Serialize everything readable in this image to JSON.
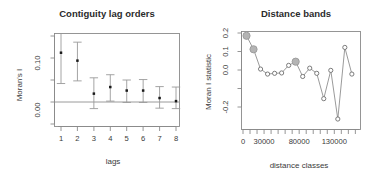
{
  "figure": {
    "background": "#ffffff",
    "width": 385,
    "height": 180
  },
  "chart_data": [
    {
      "id": "contiguity-lag-orders",
      "type": "scatter",
      "title": "Contiguity lag orders",
      "xlabel": "lags",
      "ylabel": "Moran's I",
      "grid": false,
      "legend": null,
      "xlim": [
        0.5,
        8.5
      ],
      "ylim": [
        -0.035,
        0.175
      ],
      "xticks": [
        1,
        2,
        3,
        4,
        5,
        6,
        7,
        8
      ],
      "xtick_labels": [
        "1",
        "2",
        "3",
        "4",
        "5",
        "6",
        "7",
        "8"
      ],
      "yticks": [
        0.0,
        0.1
      ],
      "ytick_labels": [
        "0.00",
        "0.10"
      ],
      "yticks_minor": [
        0.05,
        0.15
      ],
      "reference_line_y": 0.0,
      "categories": [
        "1",
        "2",
        "3",
        "4",
        "5",
        "6",
        "7",
        "8"
      ],
      "values": [
        0.112,
        0.094,
        0.019,
        0.034,
        0.026,
        0.026,
        0.009,
        0.002
      ],
      "error_low": [
        0.042,
        0.048,
        -0.015,
        0.002,
        -0.001,
        -0.001,
        -0.014,
        -0.015
      ],
      "error_high": [
        0.175,
        0.136,
        0.055,
        0.062,
        0.05,
        0.051,
        0.035,
        0.034
      ],
      "marker": "filled-square",
      "marker_color": "#1a1a1a",
      "errorbar_color": "#9a9a9a"
    },
    {
      "id": "distance-bands",
      "type": "line",
      "title": "Distance bands",
      "xlabel": "distance classes",
      "ylabel": "Moran I statistic",
      "grid": false,
      "legend": null,
      "xlim": [
        0,
        165000
      ],
      "ylim": [
        -0.29,
        0.21
      ],
      "xticks": [
        0,
        30000,
        80000,
        130000
      ],
      "xtick_labels": [
        "0",
        "30000",
        "80000",
        "130000"
      ],
      "xticks_minor": [
        10000,
        20000,
        40000,
        50000,
        60000,
        70000,
        90000,
        100000,
        110000,
        120000,
        140000,
        150000,
        160000
      ],
      "yticks": [
        0.2,
        0.1,
        0.0,
        -0.2
      ],
      "ytick_labels": [
        "0.2",
        "0.1",
        "0.0",
        "-0.2"
      ],
      "yticks_minor": [
        -0.1
      ],
      "x": [
        5000,
        15000,
        25000,
        35000,
        45000,
        55000,
        65000,
        75000,
        85000,
        95000,
        105000,
        115000,
        125000,
        135000,
        145000,
        155000
      ],
      "values": [
        0.185,
        0.112,
        0.005,
        -0.022,
        -0.018,
        -0.016,
        0.025,
        0.045,
        -0.035,
        0.01,
        -0.018,
        -0.155,
        -0.002,
        -0.265,
        0.122,
        -0.022
      ],
      "series": [
        {
          "name": "Moran I statistic",
          "values": [
            0.185,
            0.112,
            0.005,
            -0.022,
            -0.018,
            -0.016,
            0.025,
            0.045,
            -0.035,
            0.01,
            -0.018,
            -0.155,
            -0.002,
            -0.265,
            0.122,
            -0.022
          ]
        }
      ],
      "highlighted_indices": [
        0,
        1,
        7
      ],
      "highlight_marker": "filled-circle",
      "highlight_color": "#b4b4b4",
      "marker": "open-circle",
      "marker_color": "#6e6e6e",
      "line_color": "#8f8f8f"
    }
  ]
}
